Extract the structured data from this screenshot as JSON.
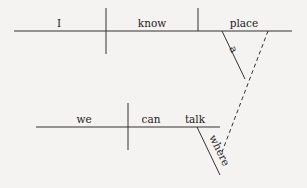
{
  "diagram": {
    "type": "sentence-diagram",
    "main_clause": {
      "subject": "I",
      "verb": "know",
      "object": "place",
      "modifiers": [
        {
          "word": "a",
          "modifies": "place"
        }
      ]
    },
    "subordinate_clause": {
      "subject": "we",
      "verb": "can talk",
      "verb_parts": [
        "can",
        "talk"
      ],
      "modifiers": [
        {
          "word": "where",
          "modifies": "talk"
        }
      ],
      "connector": "dashed line from 'where' to 'place'"
    }
  },
  "words": {
    "I": "I",
    "know": "know",
    "place": "place",
    "a": "a",
    "we": "we",
    "can": "can",
    "talk": "talk",
    "where": "where"
  },
  "colors": {
    "ink": "#333333",
    "paper": "#f4f3f1"
  }
}
